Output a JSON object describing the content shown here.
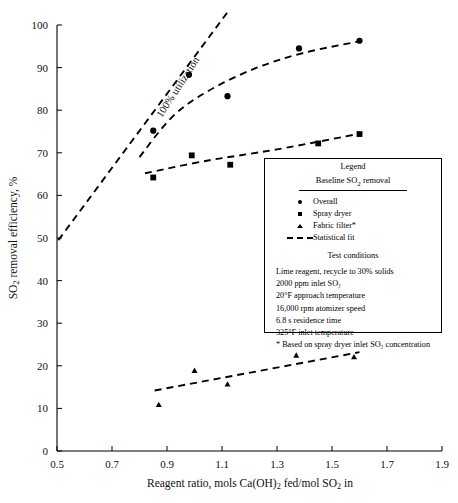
{
  "chart_data": {
    "type": "scatter",
    "title": "",
    "xlabel": "Reagent ratio, mols Ca(OH)2 fed/mol SO2 in",
    "ylabel": "SO2 removal efficiency, %",
    "xlim": [
      0.5,
      1.9
    ],
    "ylim": [
      0,
      100
    ],
    "xticks": [
      "0.5",
      "0.7",
      "0.9",
      "1.1",
      "1.3",
      "1.5",
      "1.7",
      "1.9"
    ],
    "yticks": [
      "0",
      "10",
      "20",
      "30",
      "40",
      "50",
      "60",
      "70",
      "80",
      "90",
      "100"
    ],
    "grid": false,
    "legend_position": "inside-right",
    "annotations": [
      {
        "text": "100% utilization",
        "x": 0.95,
        "y": 85,
        "rotation": -57
      }
    ],
    "series": [
      {
        "name": "Overall",
        "marker": "circle",
        "points": [
          {
            "x": 0.85,
            "y": 75.2
          },
          {
            "x": 0.98,
            "y": 88.3
          },
          {
            "x": 1.12,
            "y": 83.3
          },
          {
            "x": 1.38,
            "y": 94.5
          },
          {
            "x": 1.6,
            "y": 96.3
          }
        ]
      },
      {
        "name": "Spray dryer",
        "marker": "square",
        "points": [
          {
            "x": 0.85,
            "y": 64.2
          },
          {
            "x": 0.99,
            "y": 69.4
          },
          {
            "x": 1.13,
            "y": 67.2
          },
          {
            "x": 1.45,
            "y": 72.2
          },
          {
            "x": 1.6,
            "y": 74.4
          }
        ]
      },
      {
        "name": "Fabric filter*",
        "marker": "triangle",
        "points": [
          {
            "x": 0.87,
            "y": 10.8
          },
          {
            "x": 1.0,
            "y": 18.8
          },
          {
            "x": 1.12,
            "y": 15.6
          },
          {
            "x": 1.37,
            "y": 22.4
          },
          {
            "x": 1.58,
            "y": 22.0
          }
        ]
      }
    ],
    "fits": [
      {
        "name": "100% utilization line",
        "style": "dashed",
        "points": [
          {
            "x": 0.505,
            "y": 49.5
          },
          {
            "x": 1.12,
            "y": 103.0
          }
        ]
      },
      {
        "name": "Overall statistical fit",
        "style": "dashed",
        "points": [
          {
            "x": 0.8,
            "y": 69.0
          },
          {
            "x": 0.92,
            "y": 78.5
          },
          {
            "x": 1.05,
            "y": 84.5
          },
          {
            "x": 1.22,
            "y": 89.8
          },
          {
            "x": 1.4,
            "y": 93.5
          },
          {
            "x": 1.61,
            "y": 96.3
          }
        ]
      },
      {
        "name": "Spray dryer statistical fit",
        "style": "dashed",
        "points": [
          {
            "x": 0.82,
            "y": 65.2
          },
          {
            "x": 1.05,
            "y": 68.2
          },
          {
            "x": 1.3,
            "y": 70.8
          },
          {
            "x": 1.61,
            "y": 74.6
          }
        ]
      },
      {
        "name": "Fabric filter statistical fit",
        "style": "dashed",
        "points": [
          {
            "x": 0.855,
            "y": 14.2
          },
          {
            "x": 1.6,
            "y": 23.2
          }
        ]
      }
    ]
  },
  "axes": {
    "y_title_main": "SO",
    "y_title_sub": "2",
    "y_title_rest": " removal efficiency, %",
    "x_title_a": "Reagent ratio, mols Ca(OH)",
    "x_title_sub1": "2",
    "x_title_b": " fed/mol SO",
    "x_title_sub2": "2",
    "x_title_c": " in"
  },
  "annotation": {
    "utilization_label": "100% utilization"
  },
  "legend": {
    "title": "Legend",
    "subtitle_a": "Baseline SO",
    "subtitle_sub": "2",
    "subtitle_b": " removal",
    "entries": [
      {
        "marker": "circle-marker",
        "label": "Overall"
      },
      {
        "marker": "square-marker",
        "label": "Spray dryer"
      },
      {
        "marker": "triangle-marker",
        "label": "Fabric filter*"
      },
      {
        "marker": "dashed-line-marker",
        "label": "Statistical fit"
      }
    ],
    "conditions_title": "Test conditions",
    "conditions": [
      "Lime reagent, recycle to 30% solids",
      "2000 ppm inlet SO₂",
      "20°F approach temperature",
      "16,000 rpm atomizer speed",
      "6.8 s residence time",
      "325°F inlet temperature",
      "* Based on spray dryer inlet SO₂ concentration"
    ]
  },
  "colors": {
    "ink": "#000000",
    "background": "#ffffff"
  }
}
